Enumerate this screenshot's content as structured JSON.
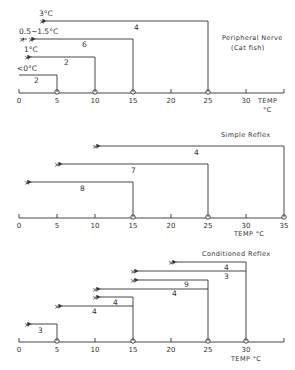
{
  "axis": {
    "origin_px": 19,
    "px_per_degree": 7.55,
    "ticks": [
      "0",
      "5",
      "10",
      "15",
      "20",
      "25",
      "30",
      "35"
    ],
    "unit_label_temp": "TEMP",
    "unit_label_c": "°C"
  },
  "panels": [
    {
      "id": "peripheral-nerve",
      "title_line1": "Peripheral  Nerve",
      "title_line2": "(Cat fish)",
      "axis_label": "TEMP",
      "axis_unit": "°C",
      "tick_labels": [
        "0",
        "5",
        "10",
        "15",
        "20",
        "25",
        "30"
      ],
      "entries": [
        {
          "from": 25,
          "to": 3,
          "count": "4",
          "endpoint_label": "3°C"
        },
        {
          "from": 15,
          "to": 1.5,
          "count": "6",
          "endpoint_label": "0.5∼1.5°C"
        },
        {
          "from": 10,
          "to": 1,
          "count": "2",
          "endpoint_label": "1°C"
        },
        {
          "from": 5,
          "to": 0,
          "count": "2",
          "endpoint_label": "<0°C"
        }
      ]
    },
    {
      "id": "simple-reflex",
      "title_line1": "Simple  Reflex",
      "axis_label": "TEMP  °C",
      "tick_labels": [
        "0",
        "5",
        "10",
        "15",
        "20",
        "25",
        "30",
        "35"
      ],
      "entries": [
        {
          "from": 35,
          "to": 10,
          "count": "4"
        },
        {
          "from": 25,
          "to": 5,
          "count": "7"
        },
        {
          "from": 15,
          "to": 1,
          "count": "8"
        }
      ]
    },
    {
      "id": "conditioned-reflex",
      "title_line1": "Conditioned  Reflex",
      "axis_label": "TEMP  °C",
      "tick_labels": [
        "0",
        "5",
        "10",
        "15",
        "20",
        "25",
        "30"
      ],
      "entries": [
        {
          "from": 30,
          "to": 20,
          "count": "4"
        },
        {
          "from": 30,
          "to": 15,
          "count": "3"
        },
        {
          "from": 25,
          "to": 15,
          "count": "9"
        },
        {
          "from": 25,
          "to": 10,
          "count": "4"
        },
        {
          "from": 15,
          "to": 10,
          "count": "4"
        },
        {
          "from": 15,
          "to": 5,
          "count": "4"
        },
        {
          "from": 5,
          "to": 1,
          "count": "3"
        }
      ]
    }
  ],
  "text": {
    "p1_title1": "Peripheral  Nerve",
    "p1_title2": "(Cat fish)",
    "p1_temp": "TEMP",
    "p1_c": "°C",
    "p1_l3c": "3°C",
    "p1_l05": "0.5∼1.5°C",
    "p1_l1c": "1°C",
    "p1_l0c": "<0°C",
    "p1_n4": "4",
    "p1_n6": "6",
    "p1_n2a": "2",
    "p1_n2b": "2",
    "p2_title": "Simple  Reflex",
    "p2_temp": "TEMP  °C",
    "p2_n4": "4",
    "p2_n7": "7",
    "p2_n8": "8",
    "p3_title": "Conditioned  Reflex",
    "p3_temp": "TEMP  °C",
    "p3_n1": "4",
    "p3_n2": "3",
    "p3_n3": "9",
    "p3_n4": "4",
    "p3_n5": "4",
    "p3_n6": "4",
    "p3_n7": "3",
    "t0": "0",
    "t5": "5",
    "t10": "10",
    "t15": "15",
    "t20": "20",
    "t25": "25",
    "t30": "30",
    "t35": "35"
  },
  "colors": {
    "ink": "#333333",
    "background": "#ffffff"
  }
}
